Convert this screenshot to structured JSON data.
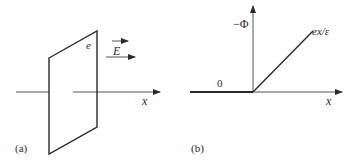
{
  "panels": {
    "a": {
      "caption": "(a)",
      "charge_label": "e",
      "field_label": "E",
      "axis_label": "x"
    },
    "b": {
      "caption": "(b)",
      "y_axis_label": "−Φ",
      "line_label": "ex/ε",
      "zero_label": "0",
      "x_axis_label": "x"
    }
  },
  "colors": {
    "ink": "#2a2a2a",
    "background": "#ffffff"
  }
}
